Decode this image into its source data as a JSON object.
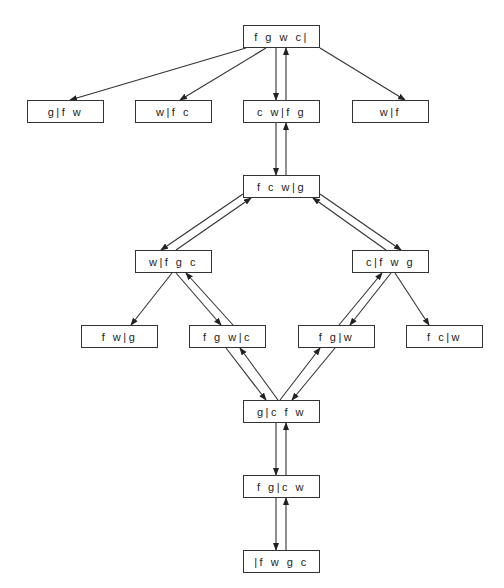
{
  "diagram": {
    "type": "state-transition-graph",
    "colors": {
      "stroke": "#333333",
      "text": "#222222",
      "background": "#ffffff"
    },
    "nodes": [
      {
        "id": "n0",
        "label": "fgwc|",
        "x": 243,
        "y": 25,
        "w": 77,
        "h": 23
      },
      {
        "id": "n1",
        "label": "g|fw",
        "x": 27,
        "y": 100,
        "w": 77,
        "h": 23
      },
      {
        "id": "n2",
        "label": "w|fc",
        "x": 135,
        "y": 100,
        "w": 77,
        "h": 23
      },
      {
        "id": "n3",
        "label": "cw|fg",
        "x": 243,
        "y": 100,
        "w": 77,
        "h": 23
      },
      {
        "id": "n4",
        "label": "w|f",
        "x": 352,
        "y": 100,
        "w": 77,
        "h": 23
      },
      {
        "id": "n5",
        "label": "fcw|g",
        "x": 243,
        "y": 175,
        "w": 77,
        "h": 23
      },
      {
        "id": "n6",
        "label": "w|fgc",
        "x": 135,
        "y": 250,
        "w": 77,
        "h": 23
      },
      {
        "id": "n7",
        "label": "c|fwg",
        "x": 352,
        "y": 250,
        "w": 77,
        "h": 23
      },
      {
        "id": "n8",
        "label": "fw|g",
        "x": 81,
        "y": 325,
        "w": 77,
        "h": 23
      },
      {
        "id": "n9",
        "label": "fgw|c",
        "x": 189,
        "y": 325,
        "w": 77,
        "h": 23
      },
      {
        "id": "n10",
        "label": "fg|w",
        "x": 298,
        "y": 325,
        "w": 77,
        "h": 23
      },
      {
        "id": "n11",
        "label": "fc|w",
        "x": 406,
        "y": 325,
        "w": 77,
        "h": 23
      },
      {
        "id": "n12",
        "label": "g|cfw",
        "x": 243,
        "y": 400,
        "w": 77,
        "h": 23
      },
      {
        "id": "n13",
        "label": "fg|cw",
        "x": 243,
        "y": 475,
        "w": 77,
        "h": 23
      },
      {
        "id": "n14",
        "label": "|fwgc",
        "x": 243,
        "y": 550,
        "w": 77,
        "h": 23
      }
    ],
    "edges": [
      {
        "from": "n0",
        "to": "n1",
        "x1": 246,
        "y1": 48,
        "x2": 70,
        "y2": 100
      },
      {
        "from": "n0",
        "to": "n2",
        "x1": 266,
        "y1": 48,
        "x2": 180,
        "y2": 100
      },
      {
        "from": "n0",
        "to": "n3",
        "x1": 276,
        "y1": 48,
        "x2": 276,
        "y2": 100
      },
      {
        "from": "n3",
        "to": "n0",
        "x1": 286,
        "y1": 100,
        "x2": 286,
        "y2": 48
      },
      {
        "from": "n0",
        "to": "n4",
        "x1": 320,
        "y1": 48,
        "x2": 405,
        "y2": 100
      },
      {
        "from": "n3",
        "to": "n5",
        "x1": 276,
        "y1": 123,
        "x2": 276,
        "y2": 175
      },
      {
        "from": "n5",
        "to": "n3",
        "x1": 286,
        "y1": 175,
        "x2": 286,
        "y2": 123
      },
      {
        "from": "n5",
        "to": "n6",
        "x1": 243,
        "y1": 194,
        "x2": 161,
        "y2": 250
      },
      {
        "from": "n6",
        "to": "n5",
        "x1": 176,
        "y1": 250,
        "x2": 251,
        "y2": 198
      },
      {
        "from": "n5",
        "to": "n7",
        "x1": 320,
        "y1": 194,
        "x2": 401,
        "y2": 250
      },
      {
        "from": "n7",
        "to": "n5",
        "x1": 386,
        "y1": 250,
        "x2": 313,
        "y2": 198
      },
      {
        "from": "n6",
        "to": "n8",
        "x1": 172,
        "y1": 273,
        "x2": 131,
        "y2": 325
      },
      {
        "from": "n6",
        "to": "n9",
        "x1": 176,
        "y1": 273,
        "x2": 221,
        "y2": 325
      },
      {
        "from": "n9",
        "to": "n6",
        "x1": 233,
        "y1": 325,
        "x2": 186,
        "y2": 273
      },
      {
        "from": "n10",
        "to": "n7",
        "x1": 339,
        "y1": 325,
        "x2": 382,
        "y2": 273
      },
      {
        "from": "n7",
        "to": "n10",
        "x1": 391,
        "y1": 273,
        "x2": 350,
        "y2": 325
      },
      {
        "from": "n7",
        "to": "n11",
        "x1": 395,
        "y1": 273,
        "x2": 429,
        "y2": 325
      },
      {
        "from": "n9",
        "to": "n12",
        "x1": 226,
        "y1": 348,
        "x2": 266,
        "y2": 400
      },
      {
        "from": "n12",
        "to": "n9",
        "x1": 278,
        "y1": 400,
        "x2": 240,
        "y2": 348
      },
      {
        "from": "n12",
        "to": "n10",
        "x1": 280,
        "y1": 400,
        "x2": 320,
        "y2": 348
      },
      {
        "from": "n10",
        "to": "n12",
        "x1": 335,
        "y1": 348,
        "x2": 292,
        "y2": 400
      },
      {
        "from": "n12",
        "to": "n13",
        "x1": 276,
        "y1": 423,
        "x2": 276,
        "y2": 475
      },
      {
        "from": "n13",
        "to": "n12",
        "x1": 286,
        "y1": 475,
        "x2": 286,
        "y2": 423
      },
      {
        "from": "n13",
        "to": "n14",
        "x1": 276,
        "y1": 498,
        "x2": 276,
        "y2": 550
      },
      {
        "from": "n14",
        "to": "n13",
        "x1": 286,
        "y1": 550,
        "x2": 286,
        "y2": 498
      }
    ]
  }
}
